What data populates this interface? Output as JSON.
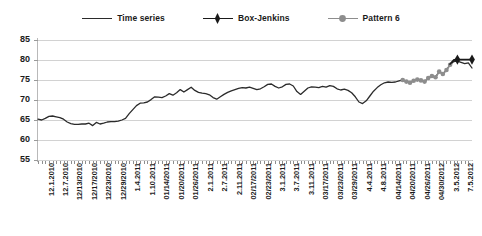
{
  "legend": {
    "position": "top-center",
    "items": [
      {
        "label": "Time series",
        "marker": "none",
        "color": "#2b2b2b",
        "icon": "line-icon"
      },
      {
        "label": "Box-Jenkins",
        "marker": "diamond",
        "color": "#1a1a1a",
        "icon": "diamond-marker-icon"
      },
      {
        "label": "Pattern 6",
        "marker": "circle",
        "color": "#8d8d8d",
        "icon": "circle-marker-icon"
      }
    ]
  },
  "colors": {
    "time_series": "#2b2b2b",
    "box_jenkins": "#1a1a1a",
    "pattern_6": "#8d8d8d",
    "grid": "#d2d2d2",
    "axis": "#b9b9b9",
    "background": "#ffffff"
  },
  "chart_data": {
    "type": "line",
    "title": "",
    "subtitle": "",
    "xlabel": "",
    "ylabel": "",
    "ylim": [
      55,
      85
    ],
    "yticks": [
      85,
      80,
      75,
      70,
      65,
      60,
      55
    ],
    "grid": true,
    "legend_position": "top-center",
    "xtick_labels": [
      "12.1.2010",
      "12.7.2010",
      "12/13/2010",
      "12/17/2010",
      "12/23/2010",
      "12/29/2010",
      "1.4.2011",
      "1.10.2011",
      "01/14/2011",
      "01/20/2011",
      "01/26/2011",
      "2.1.2011",
      "2.7.2011",
      "2.11.2011",
      "02/17/2011",
      "02/23/2011",
      "3.1.2011",
      "3.7.2011",
      "3.11.2011",
      "03/17/2011",
      "03/23/2011",
      "03/29/2011",
      "4.4.2011",
      "4.8.2011",
      "04/14/2011",
      "04/20/2011",
      "04/26/2011",
      "04/30/2012",
      "3.5.2012",
      "7.5.2012"
    ],
    "n_points": 120,
    "series": [
      {
        "name": "Time series",
        "marker": "none",
        "color": "#2b2b2b",
        "x_start_index": 0,
        "values": [
          65.2,
          65.0,
          65.4,
          65.9,
          66.0,
          65.8,
          65.6,
          65.2,
          64.5,
          64.1,
          63.9,
          63.9,
          64.0,
          64.0,
          64.2,
          63.6,
          64.4,
          64.0,
          64.2,
          64.5,
          64.6,
          64.6,
          64.7,
          65.0,
          65.4,
          66.6,
          67.6,
          68.6,
          69.2,
          69.3,
          69.5,
          70.1,
          70.8,
          70.7,
          70.6,
          71.0,
          71.6,
          71.2,
          71.8,
          72.6,
          72.0,
          72.6,
          73.2,
          72.4,
          71.9,
          71.7,
          71.6,
          71.3,
          70.6,
          70.2,
          70.8,
          71.4,
          71.9,
          72.3,
          72.6,
          72.9,
          73.1,
          73.0,
          73.2,
          72.9,
          72.6,
          72.8,
          73.3,
          73.9,
          74.0,
          73.4,
          73.0,
          73.3,
          73.9,
          74.0,
          73.5,
          72.1,
          71.4,
          72.2,
          73.0,
          73.3,
          73.2,
          73.1,
          73.4,
          73.2,
          73.6,
          73.4,
          72.8,
          72.5,
          72.7,
          72.4,
          71.8,
          70.8,
          69.5,
          69.1,
          69.8,
          71.0,
          72.2,
          73.1,
          73.8,
          74.3,
          74.5,
          74.4,
          74.5,
          74.8,
          75.0,
          74.6,
          74.3,
          74.8,
          75.1,
          74.9,
          74.6,
          75.5,
          76.0,
          75.7,
          77.1,
          76.5,
          77.5,
          78.8,
          79.6,
          79.7,
          79.4,
          79.1,
          79.3,
          78.0
        ]
      },
      {
        "name": "Pattern 6",
        "marker": "circle",
        "color": "#8d8d8d",
        "x_start_index": 100,
        "values": [
          75.0,
          74.6,
          74.3,
          74.8,
          75.1,
          74.9,
          74.6,
          75.5,
          76.0,
          75.7,
          77.1,
          76.5,
          77.5,
          78.8
        ]
      },
      {
        "name": "Box-Jenkins",
        "marker": "diamond",
        "color": "#1a1a1a",
        "x_start_index": 113,
        "values": [
          79.0,
          80.0,
          80.1,
          80.1,
          80.1,
          80.1,
          80.1
        ],
        "marker_indices": [
          2,
          6
        ]
      }
    ]
  }
}
